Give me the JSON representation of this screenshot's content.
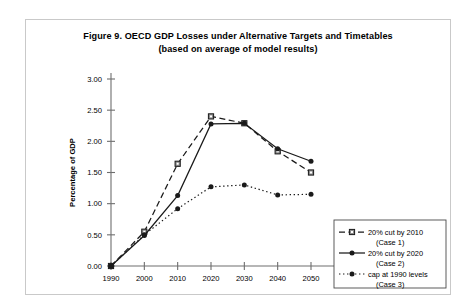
{
  "figure": {
    "title_line1": "Figure 9.  OECD GDP Losses under Alternative Targets and Timetables",
    "title_line2": "(based on average of model results)"
  },
  "chart_data": {
    "type": "line",
    "title": "Figure 9.  OECD GDP Losses under Alternative Targets and Timetables (based on average of model results)",
    "xlabel": "",
    "ylabel": "Percentage of GDP",
    "categories": [
      "1990",
      "2000",
      "2010",
      "2020",
      "2030",
      "2040",
      "2050"
    ],
    "x": [
      1990,
      2000,
      2010,
      2020,
      2030,
      2040,
      2050
    ],
    "xlim": [
      1990,
      2050
    ],
    "ylim": [
      0.0,
      3.0
    ],
    "ytick_labels": [
      "0.00",
      "0.50",
      "1.00",
      "1.50",
      "2.00",
      "2.50",
      "3.00"
    ],
    "yticks": [
      0.0,
      0.5,
      1.0,
      1.5,
      2.0,
      2.5,
      3.0
    ],
    "grid": false,
    "legend_position": "bottom-right",
    "series": [
      {
        "name": "20% cut by 2010 (Case 1)",
        "legend_line1": "20% cut by 2010",
        "legend_line2": "(Case 1)",
        "marker": "square-open",
        "dash": "dashed",
        "color": "#1a1a1a",
        "values": [
          0.0,
          0.55,
          1.64,
          2.4,
          2.29,
          1.84,
          1.5
        ]
      },
      {
        "name": "20% cut by 2020 (Case 2)",
        "legend_line1": "20% cut by 2020",
        "legend_line2": "(Case 2)",
        "marker": "circle-filled",
        "dash": "solid",
        "color": "#1a1a1a",
        "values": [
          0.0,
          0.49,
          1.13,
          2.28,
          2.29,
          1.88,
          1.68
        ]
      },
      {
        "name": "cap at 1990 levels (Case 3)",
        "legend_line1": "cap at 1990 levels",
        "legend_line2": "(Case 3)",
        "marker": "circle-filled",
        "dash": "dotted",
        "color": "#1a1a1a",
        "values": [
          0.0,
          0.5,
          0.92,
          1.27,
          1.3,
          1.14,
          1.15
        ]
      }
    ]
  }
}
